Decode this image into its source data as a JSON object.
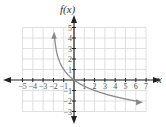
{
  "chart_data": {
    "type": "line",
    "title": "",
    "xlabel": "x",
    "ylabel": "f(x)",
    "xlim": [
      -5,
      7
    ],
    "ylim": [
      -3,
      5
    ],
    "x_ticks": [
      -5,
      -4,
      -3,
      -2,
      -1,
      1,
      2,
      3,
      4,
      5,
      6,
      7
    ],
    "y_ticks": [
      -3,
      -2,
      -1,
      1,
      2,
      3,
      4,
      5
    ],
    "grid": true,
    "series": [
      {
        "name": "f(x)",
        "color": "#8a8a8a",
        "x": [
          -1.9,
          -1.75,
          -1.5,
          -1,
          0,
          1,
          2,
          4,
          6.5
        ],
        "y": [
          4.3,
          3.0,
          2.0,
          1.0,
          0.0,
          -0.58,
          -1.0,
          -1.58,
          -2.09
        ],
        "arrows": "both ends"
      }
    ]
  },
  "axes": {
    "x_label": "x",
    "y_label": "f(x)"
  }
}
